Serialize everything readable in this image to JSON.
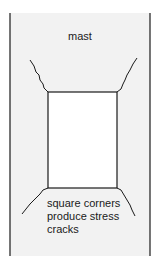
{
  "diagram": {
    "title_label": "mast",
    "caption_lines": [
      "square corners",
      "produce stress",
      "cracks"
    ],
    "colors": {
      "mast_fill": "#f2f2f2",
      "opening_fill": "#ffffff",
      "line": "#1a1a1a"
    }
  }
}
